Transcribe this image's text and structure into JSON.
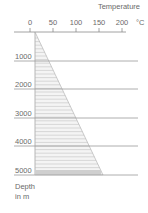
{
  "chart_data": {
    "type": "area",
    "title": "",
    "xlabel": "Temperature",
    "x_unit": "°C",
    "ylabel": "Depth in m",
    "ylabel_lines": [
      "Depth",
      "in m"
    ],
    "x_ticks": [
      0,
      50,
      100,
      150,
      200
    ],
    "x_tick_labels": [
      "0",
      "50",
      "100",
      "150",
      "200"
    ],
    "y_ticks": [
      1000,
      2000,
      3000,
      4000,
      5000
    ],
    "y_tick_labels": [
      "1000",
      "2000",
      "3000",
      "4000",
      "5000"
    ],
    "xlim": [
      0,
      220
    ],
    "ylim": [
      5000,
      0
    ],
    "grid": true,
    "legend": null,
    "series": [
      {
        "name": "Temperature gradient",
        "depth_m": [
          0,
          1000,
          2000,
          3000,
          4000,
          5000
        ],
        "temperature_c": [
          10,
          40,
          70,
          100,
          130,
          160
        ]
      }
    ]
  },
  "labels": {
    "x_axis_title": "Temperature",
    "x_unit": "°C",
    "y_axis_title_line1": "Depth",
    "y_axis_title_line2": "in m"
  },
  "colors": {
    "axis": "#8a8a8a",
    "grid": "#9a9a9a",
    "hatch": "#b8b8b8",
    "text": "#6a6a6a"
  }
}
